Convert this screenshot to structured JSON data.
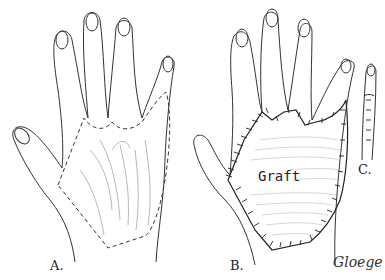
{
  "figure": {
    "panels": [
      {
        "id": "A",
        "label": "A.",
        "description": "Dorsum of hand with scarred area outlined by dashed line"
      },
      {
        "id": "B",
        "label": "B.",
        "description": "Hand with skin graft sutured in place",
        "graft_label": "Graft"
      },
      {
        "id": "C",
        "label": "C.",
        "description": "Finger with sutured graft"
      }
    ],
    "signature": "Gloege",
    "colors": {
      "ink": "#222222",
      "background": "#ffffff"
    }
  }
}
